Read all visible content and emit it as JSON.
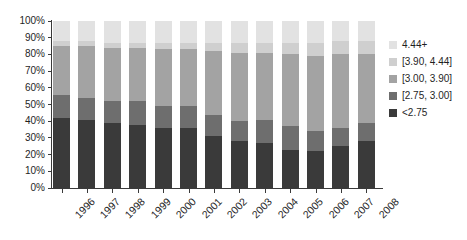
{
  "chart_data": {
    "type": "bar",
    "stacked": true,
    "stack_mode": "percent",
    "title": "",
    "xlabel": "",
    "ylabel": "",
    "ylim": [
      0,
      100
    ],
    "grid": false,
    "legend_position": "right",
    "categories": [
      "1996",
      "1997",
      "1998",
      "1999",
      "2000",
      "2001",
      "2002",
      "2003",
      "2004",
      "2005",
      "2006",
      "2007",
      "2008"
    ],
    "y_ticks": [
      "0%",
      "10%",
      "20%",
      "30%",
      "40%",
      "50%",
      "60%",
      "70%",
      "80%",
      "90%",
      "100%"
    ],
    "series": [
      {
        "name": "<2.75",
        "color": "#3a3a3a",
        "values": [
          42,
          41,
          39,
          38,
          36,
          36,
          31,
          28,
          27,
          23,
          22,
          25,
          28
        ]
      },
      {
        "name": "[2.75, 3.00]",
        "color": "#6e6e6e",
        "values": [
          14,
          13,
          13,
          14,
          13,
          13,
          13,
          12,
          14,
          14,
          12,
          11,
          11
        ]
      },
      {
        "name": "[3.00, 3.90]",
        "color": "#a3a3a3",
        "values": [
          29,
          31,
          32,
          32,
          34,
          34,
          38,
          41,
          40,
          43,
          45,
          44,
          41
        ]
      },
      {
        "name": "[3.90, 4.44]",
        "color": "#cfcfcf",
        "values": [
          3,
          3,
          3,
          3,
          4,
          4,
          5,
          6,
          6,
          7,
          8,
          8,
          8
        ]
      },
      {
        "name": "4.44+",
        "color": "#e2e2e2",
        "values": [
          12,
          12,
          13,
          13,
          13,
          13,
          13,
          13,
          13,
          13,
          13,
          12,
          12
        ]
      }
    ]
  },
  "legend": {
    "items": [
      {
        "label": "4.44+",
        "color": "#e2e2e2"
      },
      {
        "label": "[3.90, 4.44]",
        "color": "#cfcfcf"
      },
      {
        "label": "[3.00, 3.90]",
        "color": "#a3a3a3"
      },
      {
        "label": "[2.75, 3.00]",
        "color": "#6e6e6e"
      },
      {
        "label": "<2.75",
        "color": "#3a3a3a"
      }
    ]
  },
  "axis": {
    "y_label_color": "#1f1f1f",
    "line_color": "#3a3a3a"
  }
}
